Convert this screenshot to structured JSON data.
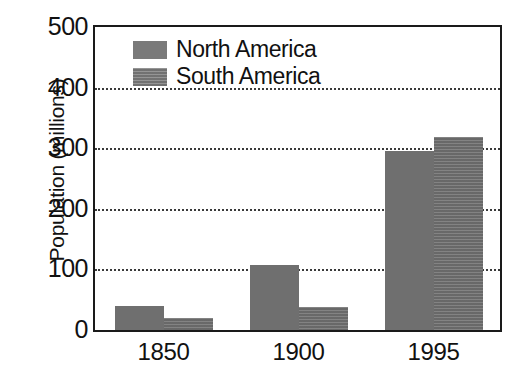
{
  "chart_data": {
    "type": "bar",
    "title": "",
    "xlabel": "",
    "ylabel": "Population (millions)",
    "categories": [
      "1850",
      "1900",
      "1995"
    ],
    "series": [
      {
        "name": "North America",
        "values": [
          40,
          108,
          295
        ],
        "color": "#6f6f6f"
      },
      {
        "name": "South America",
        "values": [
          20,
          38,
          318
        ],
        "color": "#6f6f6f"
      }
    ],
    "ylim": [
      0,
      500
    ],
    "yticks": [
      0,
      100,
      200,
      300,
      400,
      500
    ],
    "ytick_labels": [
      "0",
      "100",
      "200",
      "300",
      "400",
      "500"
    ],
    "gridlines": [
      100,
      200,
      300,
      400
    ],
    "grid": true,
    "grid_style": "dotted",
    "legend_position": "top-left",
    "frame": true,
    "units": "millions"
  },
  "axis": {
    "y_title": "Population (millions)",
    "y_tick_labels": [
      "500",
      "400",
      "300",
      "200",
      "100",
      "0"
    ],
    "x_tick_labels": [
      "1850",
      "1900",
      "1995"
    ]
  },
  "legend": {
    "entries": [
      {
        "label": "North America",
        "swatch": "north-america-swatch"
      },
      {
        "label": "South America",
        "swatch": "south-america-swatch"
      }
    ]
  },
  "clipped_header": {
    "text": ""
  }
}
